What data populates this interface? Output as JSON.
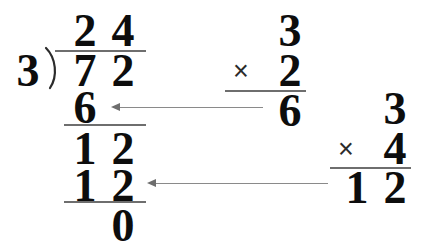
{
  "problem": {
    "type": "long-division",
    "dividend": "72",
    "divisor": "3",
    "quotient": "24",
    "remainder": "0"
  },
  "division": {
    "quotient_digits": [
      "2",
      "4"
    ],
    "dividend_digits": [
      "7",
      "2"
    ],
    "step1_product_digits": [
      "6"
    ],
    "step1_difference_digits": [
      "1",
      "2"
    ],
    "step2_product_digits": [
      "1",
      "2"
    ],
    "final_remainder": "0"
  },
  "multiplication_1": {
    "top": "3",
    "operator": "×",
    "bottom": "2",
    "product": "6"
  },
  "multiplication_2": {
    "top": "3",
    "operator": "×",
    "bottom": "4",
    "product_digits": [
      "1",
      "2"
    ]
  },
  "colors": {
    "ink": "#0d0d0d",
    "rule": "#6e6e6e",
    "arrow": "#8a8a8a",
    "background": "#ffffff"
  }
}
